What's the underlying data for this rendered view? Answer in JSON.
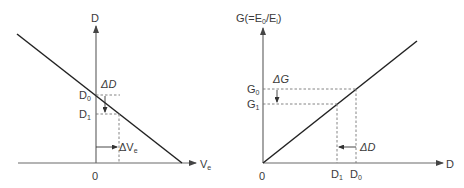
{
  "left_diagram": {
    "y_axis_label": "D",
    "x_axis_label_main": "V",
    "x_axis_label_sub": "e",
    "origin_label": "0",
    "d0_label_main": "D",
    "d0_label_sub": "0",
    "d1_label_main": "D",
    "d1_label_sub": "1",
    "delta_d_label": "ΔD",
    "delta_ve_label_main": "ΔV",
    "delta_ve_label_sub": "e"
  },
  "right_diagram": {
    "y_axis_label_pre": "G(=E",
    "y_axis_label_sub1": "0",
    "y_axis_label_mid": "/E",
    "y_axis_label_sub2": "i",
    "y_axis_label_post": ")",
    "x_axis_label": "D",
    "origin_label": "0",
    "g0_label_main": "G",
    "g0_label_sub": "0",
    "g1_label_main": "G",
    "g1_label_sub": "1",
    "d0_label_main": "D",
    "d0_label_sub": "0",
    "d1_label_main": "D",
    "d1_label_sub": "1",
    "delta_g_label": "ΔG",
    "delta_d_label": "ΔD"
  },
  "colors": {
    "curve": "#222222",
    "axis": "#6a6a6a",
    "text": "#3a3a3a"
  }
}
